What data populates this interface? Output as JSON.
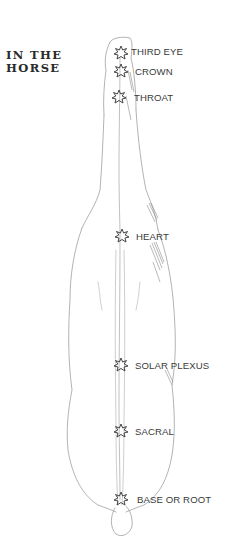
{
  "title": {
    "line1": "IN THE",
    "line2": "HORSE"
  },
  "chakras": [
    {
      "label": "THIRD EYE",
      "icon": "star-burst-icon"
    },
    {
      "label": "CROWN",
      "icon": "star-burst-icon"
    },
    {
      "label": "THROAT",
      "icon": "star-burst-icon"
    },
    {
      "label": "HEART",
      "icon": "star-burst-icon"
    },
    {
      "label": "SOLAR PLEXUS",
      "icon": "star-burst-icon"
    },
    {
      "label": "SACRAL",
      "icon": "star-burst-icon"
    },
    {
      "label": "BASE OR ROOT",
      "icon": "star-burst-icon"
    }
  ],
  "colors": {
    "ink": "#3a3a3a",
    "sketch": "#9a9a9a",
    "background": "#ffffff"
  }
}
